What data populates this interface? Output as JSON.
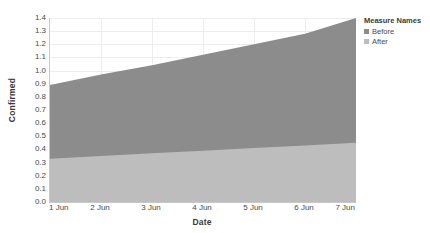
{
  "chart_data": {
    "type": "area",
    "title": "",
    "subtitle": "",
    "xlabel": "Date",
    "ylabel": "Confirmed",
    "categories": [
      "1 Jun",
      "2 Jun",
      "3 Jun",
      "4 Jun",
      "5 Jun",
      "6 Jun",
      "7 Jun"
    ],
    "x": [
      1,
      2,
      3,
      4,
      5,
      6,
      7
    ],
    "stacked": true,
    "ylim": [
      0.0,
      1.4
    ],
    "ytick_labels": [
      "0.0",
      "0.1",
      "0.2",
      "0.3",
      "0.4",
      "0.5",
      "0.6",
      "0.7",
      "0.8",
      "0.9",
      "1.0",
      "1.1",
      "1.2",
      "1.3",
      "1.4"
    ],
    "ytick_values": [
      0.0,
      0.1,
      0.2,
      0.3,
      0.4,
      0.5,
      0.6,
      0.7,
      0.8,
      0.9,
      1.0,
      1.1,
      1.2,
      1.3,
      1.4
    ],
    "grid": true,
    "grid_axis": "both",
    "legend_position": "right",
    "legend_title": "Measure Names",
    "series": [
      {
        "name": "Before",
        "color": "#8c8c8c",
        "values": [
          0.56,
          0.6,
          0.64,
          0.68,
          0.73,
          0.78,
          0.95
        ],
        "cumulative_top": [
          0.89,
          0.97,
          1.04,
          1.12,
          1.2,
          1.28,
          1.4
        ]
      },
      {
        "name": "After",
        "color": "#bdbdbd",
        "values": [
          0.33,
          0.35,
          0.37,
          0.39,
          0.41,
          0.43,
          0.45
        ],
        "cumulative_top": [
          0.33,
          0.35,
          0.37,
          0.39,
          0.41,
          0.43,
          0.45
        ]
      }
    ]
  },
  "legend": {
    "title": "Measure Names",
    "items": [
      {
        "label": "Before",
        "color": "#8c8c8c"
      },
      {
        "label": "After",
        "color": "#bdbdbd"
      }
    ]
  },
  "axes": {
    "y_title": "Confirmed",
    "x_title": "Date"
  }
}
